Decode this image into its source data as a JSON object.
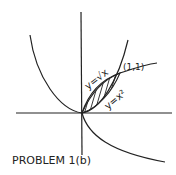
{
  "diagram": {
    "title": "PROBLEM 1(b)",
    "labels": {
      "sqrt_curve": "y=√x",
      "parabola": "y=x²",
      "intersection_point": "(1,1)"
    },
    "colors": {
      "ink": "#222222",
      "background": "#ffffff"
    },
    "shaded_region": "area between y=√x and y=x² from x=0 to x=1"
  }
}
